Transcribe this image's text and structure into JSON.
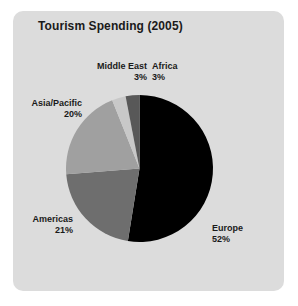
{
  "panel": {
    "background_color": "#dcdcdc",
    "page_background_color": "#ffffff"
  },
  "chart_data": {
    "type": "pie",
    "title": "Tourism Spending (2005)",
    "xlabel": "",
    "ylabel": "",
    "legend_position": "none",
    "grid": false,
    "labels_inline": true,
    "start_angle_deg": 0,
    "direction": "clockwise",
    "categories": [
      "Europe",
      "Americas",
      "Asia/Pacific",
      "Middle East",
      "Africa"
    ],
    "values": [
      52,
      21,
      20,
      3,
      3
    ],
    "value_suffix": "%",
    "colors": [
      "#000000",
      "#6e6e6e",
      "#a0a0a0",
      "#c8c8c8",
      "#585858"
    ],
    "slices": [
      {
        "name": "Europe",
        "value": 52,
        "value_text": "52%",
        "color": "#000000"
      },
      {
        "name": "Americas",
        "value": 21,
        "value_text": "21%",
        "color": "#6e6e6e"
      },
      {
        "name": "Asia/Pacific",
        "value": 20,
        "value_text": "20%",
        "color": "#a0a0a0"
      },
      {
        "name": "Middle East",
        "value": 3,
        "value_text": "3%",
        "color": "#c8c8c8"
      },
      {
        "name": "Africa",
        "value": 3,
        "value_text": "3%",
        "color": "#585858"
      }
    ]
  }
}
